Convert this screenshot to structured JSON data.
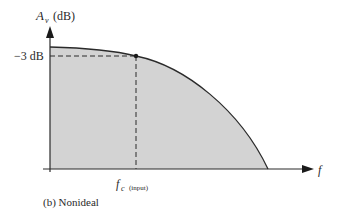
{
  "diagram": {
    "y_axis_label": "A",
    "y_axis_subscript": "v",
    "y_axis_unit": "(dB)",
    "x_axis_label": "f",
    "marker_level_label": "−3 dB",
    "cutoff_label": "f",
    "cutoff_subscript": "c",
    "cutoff_qualifier": "(input)",
    "caption": "(b) Nonideal",
    "colors": {
      "fill": "#d3d3d3",
      "line": "#2a2a2a"
    }
  }
}
